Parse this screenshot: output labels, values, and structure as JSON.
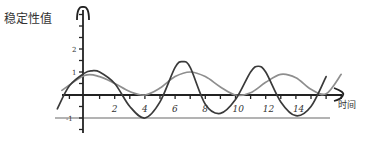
{
  "chart_data": {
    "type": "line",
    "title": "",
    "xlabel": "时间",
    "ylabel": "稳定性值",
    "x_ticks": [
      2,
      4,
      6,
      8,
      10,
      12,
      14
    ],
    "x_tick_labels": [
      "2",
      "4",
      "6",
      "8",
      "10",
      "12",
      "14"
    ],
    "y_tick_labels": [
      {
        "value": 2,
        "label": "2"
      },
      {
        "value": 1,
        "label": "1"
      },
      {
        "value": -1,
        "label": "-1"
      }
    ],
    "xlim": [
      -1.8,
      17.5
    ],
    "ylim": [
      -1.6,
      3.5
    ],
    "grid": false,
    "legend": null,
    "reference_lines": [
      {
        "y": -1,
        "color": "#9a9a9a"
      }
    ],
    "series": [
      {
        "name": "dark curve",
        "color": "#3a3a3a",
        "x": [
          -1.8,
          -1,
          0,
          0.5,
          1,
          2,
          3,
          4,
          5,
          6,
          6.5,
          7,
          8,
          9,
          10,
          11,
          11.5,
          12,
          13,
          14,
          15,
          16
        ],
        "y": [
          -0.6,
          0.4,
          0.95,
          1.05,
          1.0,
          0.5,
          -0.5,
          -1.0,
          -0.3,
          1.2,
          1.45,
          1.2,
          -0.4,
          -0.8,
          -0.2,
          1.0,
          1.25,
          1.0,
          -0.3,
          -0.9,
          -0.5,
          0.8
        ]
      },
      {
        "name": "light curve",
        "color": "#8e8e8e",
        "x": [
          -1.5,
          0,
          1,
          2,
          3,
          4,
          5,
          6,
          7,
          8,
          9,
          10,
          11,
          12,
          13,
          14,
          15,
          16,
          17
        ],
        "y": [
          0.2,
          0.85,
          0.8,
          0.5,
          0.15,
          0.0,
          0.3,
          0.8,
          1.0,
          0.8,
          0.35,
          0.0,
          0.1,
          0.55,
          0.9,
          0.75,
          0.25,
          0.05,
          0.9
        ]
      }
    ]
  }
}
